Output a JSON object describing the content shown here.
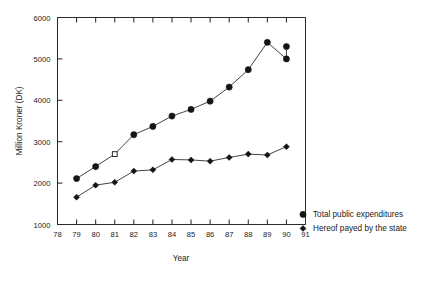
{
  "chart_data": {
    "type": "line",
    "title": "",
    "xlabel": "Year",
    "ylabel": "Million Kroner (DK)",
    "xlim": [
      78,
      91
    ],
    "ylim": [
      1000,
      6000
    ],
    "xticks": [
      "78",
      "79",
      "80",
      "81",
      "82",
      "83",
      "84",
      "85",
      "86",
      "87",
      "88",
      "89",
      "90",
      "91"
    ],
    "yticks": [
      "1000",
      "2000",
      "3000",
      "4000",
      "5000",
      "6000"
    ],
    "grid": false,
    "legend_position": "right",
    "x": [
      79,
      80,
      81,
      82,
      83,
      84,
      85,
      86,
      87,
      88,
      89,
      90
    ],
    "series": [
      {
        "name": "Total public expenditures",
        "marker": "circle",
        "values": [
          2110,
          2400,
          2700,
          3170,
          3370,
          3620,
          3780,
          3980,
          4320,
          4740,
          5400,
          5000
        ],
        "open_marker_index": 2
      },
      {
        "name": "Hereof payed by the state",
        "marker": "diamond",
        "values": [
          1660,
          1950,
          2020,
          2290,
          2320,
          2570,
          2560,
          2530,
          2620,
          2700,
          2680,
          2880
        ],
        "open_marker_index": -1
      }
    ],
    "extra_points": [
      {
        "series": 0,
        "x": 90,
        "y": 5300
      }
    ]
  },
  "legend": {
    "items": [
      {
        "label": "Total public expenditures",
        "marker": "circle"
      },
      {
        "label": "Hereof payed by the state",
        "marker": "diamond"
      }
    ]
  }
}
